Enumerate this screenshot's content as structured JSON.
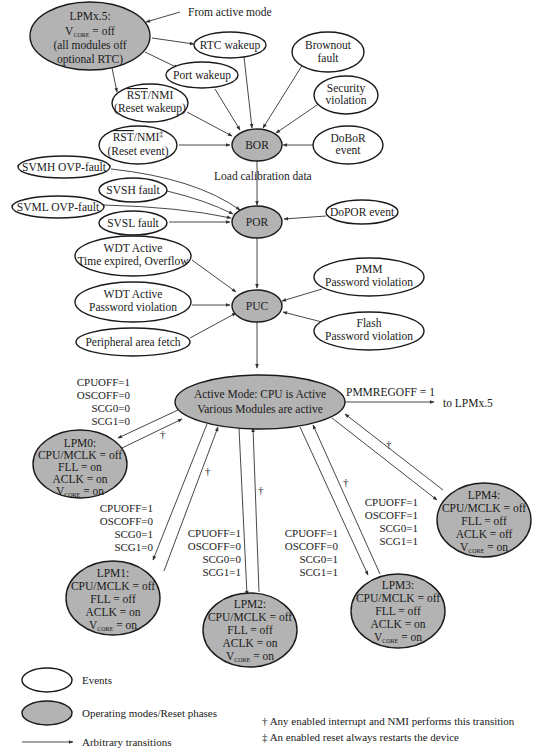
{
  "colors": {
    "event_fill": "#ffffff",
    "mode_fill": "#b3b3b3",
    "stroke": "#1a1a1a"
  },
  "modes": {
    "lpmx5": {
      "l1": "LPMx.5:",
      "l2_pre": "V",
      "l2_sub": "CORE",
      "l2_post": " = off",
      "l3": "(all modules off",
      "l4": "optional RTC)"
    },
    "bor": "BOR",
    "por": "POR",
    "puc": "PUC",
    "active": {
      "l1": "Active Mode: CPU is Active",
      "l2": "Various Modules are active"
    },
    "lpm0": {
      "l1": "LPM0:",
      "l2": "CPU/MCLK = off",
      "l3": "FLL = on",
      "l4": "ACLK = on",
      "l5_pre": "V",
      "l5_sub": "CORE",
      "l5_post": " = on"
    },
    "lpm1": {
      "l1": "LPM1:",
      "l2": "CPU/MCLK = off",
      "l3": "FLL = off",
      "l4": "ACLK = on",
      "l5_pre": "V",
      "l5_sub": "CORE",
      "l5_post": " = on"
    },
    "lpm2": {
      "l1": "LPM2:",
      "l2": "CPU/MCLK = off",
      "l3": "FLL = off",
      "l4": "ACLK = on",
      "l5_pre": "V",
      "l5_sub": "CORE",
      "l5_post": " = on"
    },
    "lpm3": {
      "l1": "LPM3:",
      "l2": "CPU/MCLK = off",
      "l3": "FLL = off",
      "l4": "ACLK = on",
      "l5_pre": "V",
      "l5_sub": "CORE",
      "l5_post": " = on"
    },
    "lpm4": {
      "l1": "LPM4:",
      "l2": "CPU/MCLK = off",
      "l3": "FLL = off",
      "l4": "ACLK = off",
      "l5_pre": "V",
      "l5_sub": "CORE",
      "l5_post": " = on"
    }
  },
  "events": {
    "rtc_wakeup": "RTC wakeup",
    "port_wakeup": "Port wakeup",
    "rst_nmi_wakeup": {
      "l1_over": "RST",
      "l1_rest": "/NMI",
      "l2": "(Reset wakeup)"
    },
    "rst_nmi_event": {
      "l1_over": "RST",
      "l1_rest": "/NMI",
      "l1_mark": "‡",
      "l2": "(Reset event)"
    },
    "brownout": {
      "l1": "Brownout",
      "l2": "fault"
    },
    "security": {
      "l1": "Security",
      "l2": "violation"
    },
    "doBoR": {
      "l1": "DoBoR",
      "l2": "event"
    },
    "svmh": "SVMH OVP-fault",
    "svsh": "SVSH fault",
    "svml": "SVML OVP-fault",
    "svsl": "SVSL fault",
    "doPOR": "DoPOR event",
    "wdt_time": {
      "l1": "WDT Active",
      "l2": "Time expired, Overflow"
    },
    "wdt_pw": {
      "l1": "WDT Active",
      "l2": "Password violation"
    },
    "peripheral": "Peripheral area fetch",
    "pmm_pw": {
      "l1": "PMM",
      "l2": "Password violation"
    },
    "flash_pw": {
      "l1": "Flash",
      "l2": "Password violation"
    }
  },
  "labels": {
    "from_active": "From active mode",
    "load_calibration": "Load calibration data",
    "pmmregoff": "PMMREGOFF = 1",
    "to_lpmx5": "to LPMx.5",
    "dagger": "†"
  },
  "conditions": {
    "lpm0": [
      "CPUOFF=1",
      "OSCOFF=0",
      "SCG0=0",
      "SCG1=0"
    ],
    "lpm1": [
      "CPUOFF=1",
      "OSCOFF=0",
      "SCG0=1",
      "SCG1=0"
    ],
    "lpm2": [
      "CPUOFF=1",
      "OSCOFF=0",
      "SCG0=0",
      "SCG1=1"
    ],
    "lpm3": [
      "CPUOFF=1",
      "OSCOFF=0",
      "SCG0=1",
      "SCG1=1"
    ],
    "lpm4": [
      "CPUOFF=1",
      "OSCOFF=1",
      "SCG0=1",
      "SCG1=1"
    ]
  },
  "legend": {
    "events": "Events",
    "modes": "Operating modes/Reset phases",
    "transitions": "Arbitrary transitions"
  },
  "footnotes": {
    "dagger": "† Any enabled interrupt and NMI performs this transition",
    "double_dagger": "‡ An enabled reset always restarts the device"
  }
}
